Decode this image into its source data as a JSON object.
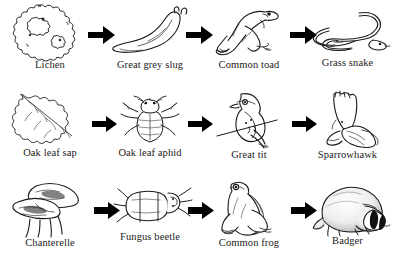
{
  "diagram": {
    "type": "food-chain-diagram",
    "background_color": "#ffffff",
    "ink_color": "#1a1a1a",
    "caption_color": "#222222",
    "arrow_color": "#000000",
    "arrow_glyph": "right-arrow",
    "rows": [
      {
        "id": "lichen-chain",
        "organisms": [
          {
            "label": "Lichen",
            "icon": "lichen-icon"
          },
          {
            "label": "Great grey slug",
            "icon": "slug-icon"
          },
          {
            "label": "Common toad",
            "icon": "toad-icon"
          },
          {
            "label": "Grass snake",
            "icon": "snake-icon"
          }
        ],
        "arrows": [
          "right-arrow",
          "right-arrow",
          "right-arrow"
        ]
      },
      {
        "id": "oak-chain",
        "organisms": [
          {
            "label": "Oak leaf sap",
            "icon": "oak-leaf-icon"
          },
          {
            "label": "Oak leaf aphid",
            "icon": "aphid-icon"
          },
          {
            "label": "Great tit",
            "icon": "great-tit-icon"
          },
          {
            "label": "Sparrowhawk",
            "icon": "sparrowhawk-icon"
          }
        ],
        "arrows": [
          "right-arrow",
          "right-arrow",
          "right-arrow"
        ]
      },
      {
        "id": "chanterelle-chain",
        "organisms": [
          {
            "label": "Chanterelle",
            "icon": "chanterelle-icon"
          },
          {
            "label": "Fungus beetle",
            "icon": "fungus-beetle-icon"
          },
          {
            "label": "Common frog",
            "icon": "frog-icon"
          },
          {
            "label": "Badger",
            "icon": "badger-icon"
          }
        ],
        "arrows": [
          "right-arrow",
          "right-arrow",
          "right-arrow"
        ]
      }
    ]
  }
}
